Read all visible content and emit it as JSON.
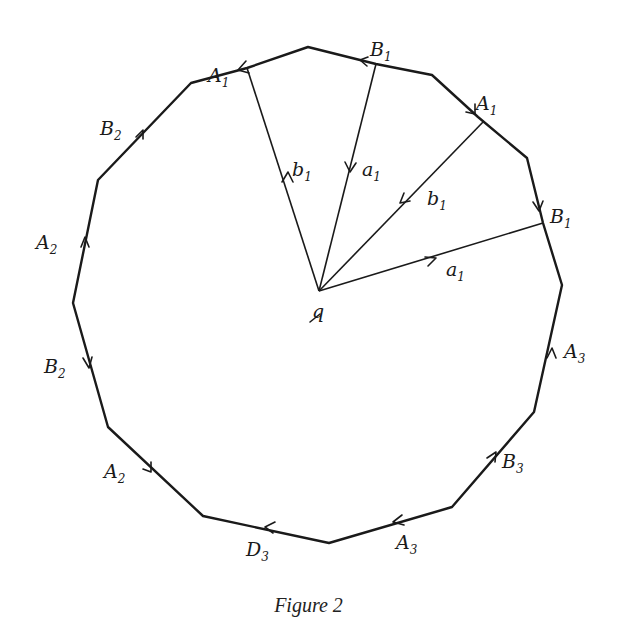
{
  "figure": {
    "caption": "Figure 2",
    "center_label": "q",
    "colors": {
      "ink": "#1a1a1a",
      "background": "#ffffff"
    },
    "polygon_vertices": [
      [
        308,
        47
      ],
      [
        247,
        68
      ],
      [
        191,
        83
      ],
      [
        98,
        180
      ],
      [
        73,
        303
      ],
      [
        108,
        427
      ],
      [
        203,
        516
      ],
      [
        329,
        543
      ],
      [
        452,
        507
      ],
      [
        534,
        412
      ],
      [
        562,
        285
      ],
      [
        543,
        223
      ],
      [
        527,
        158
      ],
      [
        478,
        117
      ],
      [
        432,
        75
      ],
      [
        376,
        64
      ]
    ],
    "center": [
      319,
      291
    ],
    "edge_labels": [
      {
        "letter": "A",
        "sub": "1",
        "x": 208,
        "y": 82
      },
      {
        "letter": "B",
        "sub": "1",
        "x": 370,
        "y": 56
      },
      {
        "letter": "A",
        "sub": "1",
        "x": 476,
        "y": 110
      },
      {
        "letter": "B",
        "sub": "1",
        "x": 550,
        "y": 223
      },
      {
        "letter": "B",
        "sub": "2",
        "x": 100,
        "y": 135
      },
      {
        "letter": "A",
        "sub": "2",
        "x": 36,
        "y": 249
      },
      {
        "letter": "B",
        "sub": "2",
        "x": 44,
        "y": 373
      },
      {
        "letter": "A",
        "sub": "2",
        "x": 104,
        "y": 478
      },
      {
        "letter": "A",
        "sub": "3",
        "x": 564,
        "y": 358
      },
      {
        "letter": "B",
        "sub": "3",
        "x": 502,
        "y": 468
      },
      {
        "letter": "D",
        "sub": "3",
        "x": 246,
        "y": 556
      },
      {
        "letter": "A",
        "sub": "3",
        "x": 396,
        "y": 549
      }
    ],
    "ray_labels": [
      {
        "letter": "b",
        "sub": "1",
        "x": 292,
        "y": 176
      },
      {
        "letter": "a",
        "sub": "1",
        "x": 362,
        "y": 176
      },
      {
        "letter": "b",
        "sub": "1",
        "x": 427,
        "y": 205
      },
      {
        "letter": "a",
        "sub": "1",
        "x": 446,
        "y": 276
      }
    ]
  }
}
